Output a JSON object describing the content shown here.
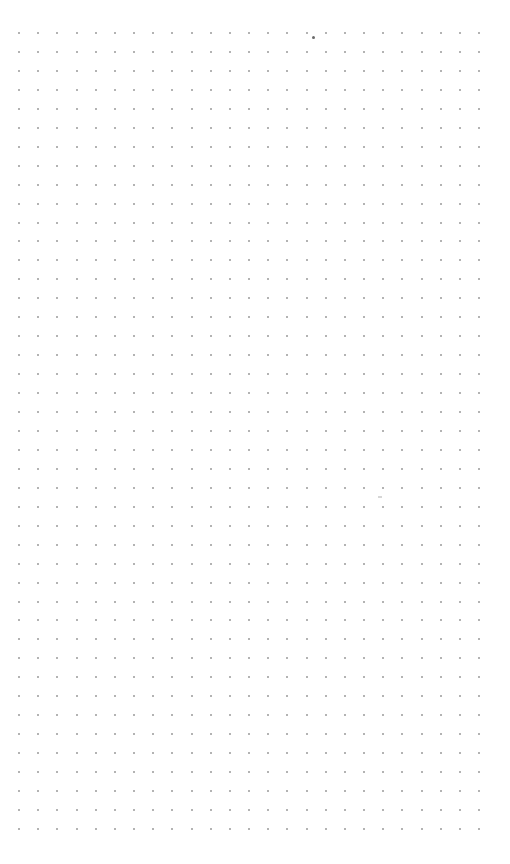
{
  "canvas": {
    "type": "dot-grid",
    "background": "#ffffff",
    "dot_color": "#9a9a9a",
    "columns": 25,
    "rows": 43,
    "origin_x": 19,
    "origin_y": 33,
    "step_x": 19.17,
    "step_y": 18.95
  },
  "marks": [
    {
      "x": 313,
      "y": 37,
      "color": "#6a6a6a"
    },
    {
      "x": 380,
      "y": 497,
      "color": "#d6d6d6"
    }
  ]
}
